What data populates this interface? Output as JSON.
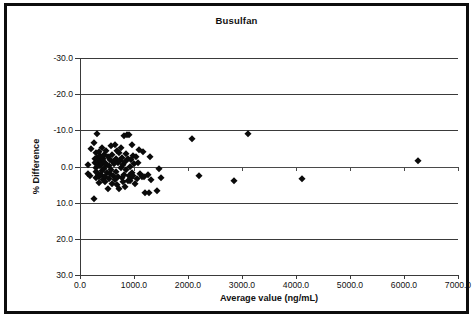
{
  "figure": {
    "title": "Busulfan",
    "border_color": "#0d0d0d",
    "background": "#ffffff"
  },
  "axes": {
    "x_title": "Average value (ng/mL)",
    "y_title": "% Difference",
    "x_tick_labels": [
      "0.0",
      "1000.0",
      "2000.0",
      "3000.0",
      "4000.0",
      "5000.0",
      "6000.0",
      "7000.0"
    ],
    "y_tick_labels": [
      "30.0",
      "20.0",
      "10.0",
      "0.0",
      "-10.0",
      "-20.0",
      "-30.0"
    ]
  },
  "chart_data": {
    "type": "scatter",
    "title": "Busulfan",
    "xlabel": "Average value (ng/mL)",
    "ylabel": "% Difference",
    "xlim": [
      0,
      7000
    ],
    "ylim": [
      -30,
      30
    ],
    "xticks": [
      0,
      1000,
      2000,
      3000,
      4000,
      5000,
      6000,
      7000
    ],
    "yticks": [
      -30,
      -20,
      -10,
      0,
      10,
      20,
      30
    ],
    "grid": "horizontal",
    "legend": "none",
    "marker": "filled-diamond",
    "marker_color": "#0a0a0a",
    "series": [
      {
        "name": "Busulfan samples",
        "points": [
          [
            140,
            0.3
          ],
          [
            150,
            -2.2
          ],
          [
            190,
            -2.6
          ],
          [
            210,
            4.9
          ],
          [
            250,
            6.4
          ],
          [
            260,
            -8.9
          ],
          [
            270,
            2.0
          ],
          [
            280,
            1.1
          ],
          [
            290,
            -1.6
          ],
          [
            295,
            -3.3
          ],
          [
            300,
            3.6
          ],
          [
            305,
            -0.4
          ],
          [
            310,
            2.4
          ],
          [
            320,
            9.0
          ],
          [
            330,
            -2.0
          ],
          [
            335,
            0.6
          ],
          [
            345,
            -3.0
          ],
          [
            350,
            1.7
          ],
          [
            355,
            4.0
          ],
          [
            360,
            -4.6
          ],
          [
            370,
            0.1
          ],
          [
            375,
            2.8
          ],
          [
            380,
            -2.4
          ],
          [
            390,
            1.4
          ],
          [
            400,
            5.1
          ],
          [
            405,
            -1.2
          ],
          [
            410,
            0.8
          ],
          [
            420,
            -3.8
          ],
          [
            430,
            2.2
          ],
          [
            440,
            -0.6
          ],
          [
            450,
            3.1
          ],
          [
            455,
            -2.8
          ],
          [
            460,
            1.0
          ],
          [
            470,
            -4.2
          ],
          [
            480,
            0.4
          ],
          [
            490,
            4.4
          ],
          [
            500,
            -1.8
          ],
          [
            510,
            2.6
          ],
          [
            520,
            -6.3
          ],
          [
            530,
            0.2
          ],
          [
            540,
            -3.4
          ],
          [
            550,
            1.9
          ],
          [
            560,
            -2.1
          ],
          [
            570,
            5.6
          ],
          [
            580,
            -0.9
          ],
          [
            590,
            3.3
          ],
          [
            600,
            -4.9
          ],
          [
            610,
            1.3
          ],
          [
            620,
            -2.5
          ],
          [
            630,
            0.7
          ],
          [
            640,
            6.0
          ],
          [
            650,
            -3.6
          ],
          [
            660,
            2.1
          ],
          [
            670,
            -1.4
          ],
          [
            680,
            4.2
          ],
          [
            690,
            -5.2
          ],
          [
            700,
            0.9
          ],
          [
            710,
            -2.9
          ],
          [
            720,
            3.8
          ],
          [
            730,
            -6.1
          ],
          [
            740,
            1.5
          ],
          [
            750,
            -0.3
          ],
          [
            760,
            5.2
          ],
          [
            770,
            -3.1
          ],
          [
            780,
            2.3
          ],
          [
            790,
            -4.4
          ],
          [
            800,
            0.5
          ],
          [
            810,
            8.5
          ],
          [
            820,
            -2.3
          ],
          [
            830,
            1.2
          ],
          [
            840,
            -5.6
          ],
          [
            850,
            3.4
          ],
          [
            860,
            -1.0
          ],
          [
            870,
            8.6
          ],
          [
            880,
            -3.9
          ],
          [
            890,
            2.0
          ],
          [
            900,
            8.6
          ],
          [
            910,
            -2.7
          ],
          [
            920,
            0.0
          ],
          [
            930,
            -4.1
          ],
          [
            940,
            1.8
          ],
          [
            950,
            -3.2
          ],
          [
            960,
            5.9
          ],
          [
            970,
            -1.7
          ],
          [
            980,
            3.0
          ],
          [
            990,
            -2.6
          ],
          [
            1000,
            0.6
          ],
          [
            1020,
            -4.8
          ],
          [
            1040,
            2.5
          ],
          [
            1060,
            -3.5
          ],
          [
            1080,
            1.1
          ],
          [
            1100,
            4.6
          ],
          [
            1120,
            -2.2
          ],
          [
            1140,
            -3.0
          ],
          [
            1160,
            3.9
          ],
          [
            1180,
            -2.8
          ],
          [
            1200,
            -7.4
          ],
          [
            1250,
            -2.4
          ],
          [
            1280,
            -7.3
          ],
          [
            1300,
            2.7
          ],
          [
            1320,
            -3.7
          ],
          [
            1420,
            -6.9
          ],
          [
            1470,
            -0.8
          ],
          [
            1500,
            -3.2
          ],
          [
            2080,
            7.5
          ],
          [
            2200,
            -2.7
          ],
          [
            2850,
            -4.1
          ],
          [
            3120,
            9.1
          ],
          [
            4120,
            -3.5
          ],
          [
            6250,
            1.6
          ]
        ]
      }
    ]
  }
}
